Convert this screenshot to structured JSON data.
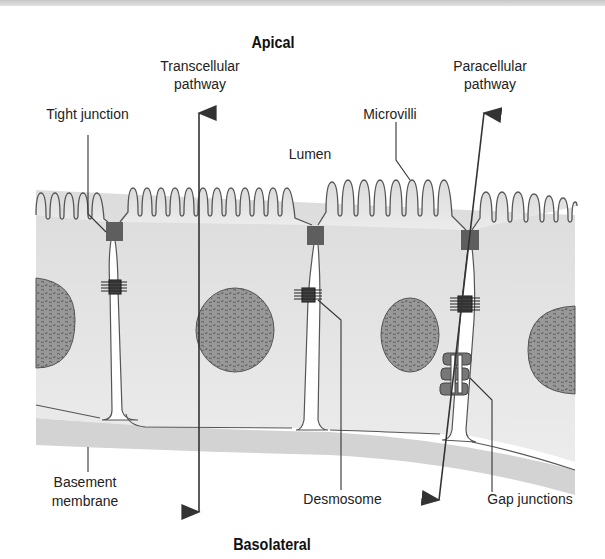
{
  "figure": {
    "title_top": "Apical",
    "title_bottom": "Basolateral",
    "labels": {
      "transcellular": [
        "Transcellular",
        "pathway"
      ],
      "paracellular": [
        "Paracellular",
        "pathway"
      ],
      "tight_junction": "Tight junction",
      "microvilli": "Microvilli",
      "lumen": "Lumen",
      "basement_membrane": [
        "Basement",
        "membrane"
      ],
      "desmosome": "Desmosome",
      "gap_junctions": "Gap junctions"
    },
    "colors": {
      "cytoplasm": "#e6e6e6",
      "basement": "#d2d2d2",
      "outline": "#555555",
      "tight_junction": "#5e5e5e",
      "nucleus": "#8a8a8a",
      "arrow": "#333333"
    }
  }
}
